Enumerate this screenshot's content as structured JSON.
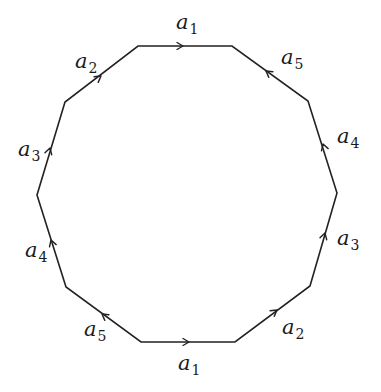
{
  "diagram": {
    "type": "polygon-identification",
    "shape": "decagon",
    "stroke_color": "#222222",
    "vertices": [
      [
        138,
        46
      ],
      [
        232,
        46
      ],
      [
        308,
        101
      ],
      [
        337,
        193
      ],
      [
        310,
        286
      ],
      [
        235,
        342
      ],
      [
        141,
        342
      ],
      [
        66,
        287
      ],
      [
        37,
        195
      ],
      [
        65,
        102
      ]
    ],
    "edges": [
      {
        "from": 0,
        "to": 1,
        "base": "a",
        "index": "1",
        "arrow": "forward",
        "arrow_at": [
          182,
          46
        ],
        "label_pos": [
          176,
          12
        ]
      },
      {
        "from": 1,
        "to": 2,
        "base": "a",
        "index": "5",
        "arrow": "backward",
        "arrow_at": [
          266,
          71
        ],
        "label_pos": [
          281,
          48
        ]
      },
      {
        "from": 2,
        "to": 3,
        "base": "a",
        "index": "4",
        "arrow": "backward",
        "arrow_at": [
          323,
          145
        ],
        "label_pos": [
          337,
          126
        ]
      },
      {
        "from": 3,
        "to": 4,
        "base": "a",
        "index": "3",
        "arrow": "backward",
        "arrow_at": [
          325,
          233
        ],
        "label_pos": [
          337,
          229
        ]
      },
      {
        "from": 4,
        "to": 5,
        "base": "a",
        "index": "2",
        "arrow": "backward",
        "arrow_at": [
          277,
          309
        ],
        "label_pos": [
          282,
          318
        ]
      },
      {
        "from": 5,
        "to": 6,
        "base": "a",
        "index": "1",
        "arrow": "backward",
        "arrow_at": [
          187,
          342
        ],
        "label_pos": [
          178,
          354
        ]
      },
      {
        "from": 6,
        "to": 7,
        "base": "a",
        "index": "5",
        "arrow": "backward",
        "arrow_at": [
          103,
          315
        ],
        "label_pos": [
          84,
          320
        ]
      },
      {
        "from": 7,
        "to": 8,
        "base": "a",
        "index": "4",
        "arrow": "backward",
        "arrow_at": [
          51,
          241
        ],
        "label_pos": [
          25,
          241
        ]
      },
      {
        "from": 8,
        "to": 9,
        "base": "a",
        "index": "3",
        "arrow": "forward",
        "arrow_at": [
          50,
          150
        ],
        "label_pos": [
          18,
          140
        ]
      },
      {
        "from": 9,
        "to": 0,
        "base": "a",
        "index": "2",
        "arrow": "forward",
        "arrow_at": [
          100,
          76
        ],
        "label_pos": [
          75,
          52
        ]
      }
    ]
  },
  "labels": {
    "top_a1": {
      "base": "a",
      "index": "1"
    },
    "top_right_a5": {
      "base": "a",
      "index": "5"
    },
    "right_upper_a4": {
      "base": "a",
      "index": "4"
    },
    "right_lower_a3": {
      "base": "a",
      "index": "3"
    },
    "bottom_right_a2": {
      "base": "a",
      "index": "2"
    },
    "bottom_a1": {
      "base": "a",
      "index": "1"
    },
    "bottom_left_a5": {
      "base": "a",
      "index": "5"
    },
    "left_lower_a4": {
      "base": "a",
      "index": "4"
    },
    "left_upper_a3": {
      "base": "a",
      "index": "3"
    },
    "top_left_a2": {
      "base": "a",
      "index": "2"
    }
  }
}
